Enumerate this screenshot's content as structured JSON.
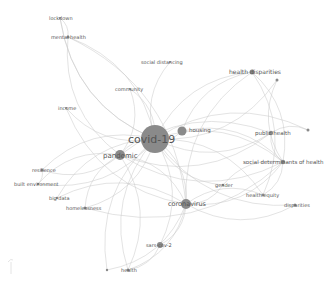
{
  "diagram": {
    "type": "keyword co-occurrence network",
    "center_node": "covid-19",
    "colors": {
      "background": "#ffffff",
      "edge": "#c9c9c9",
      "node": "#8a8a8a",
      "label": "#555555",
      "center_label": "#444444"
    },
    "nodes": [
      {
        "id": "covid-19",
        "label": "covid-19",
        "x": 155,
        "y": 139,
        "r": 14,
        "font": 11,
        "lx": 128,
        "ly": 143
      },
      {
        "id": "pandemic",
        "label": "pandemic",
        "x": 120,
        "y": 155,
        "r": 5,
        "font": 7,
        "lx": 103,
        "ly": 158
      },
      {
        "id": "coronavirus",
        "label": "coronavirus",
        "x": 186,
        "y": 204,
        "r": 5,
        "font": 6.5,
        "lx": 168,
        "ly": 206
      },
      {
        "id": "housing",
        "label": "housing",
        "x": 182,
        "y": 131,
        "r": 4.5,
        "font": 5.5,
        "lx": 189,
        "ly": 132
      },
      {
        "id": "health-disparities",
        "label": "health disparities",
        "x": 252,
        "y": 72,
        "r": 2.5,
        "font": 6,
        "lx": 229,
        "ly": 74
      },
      {
        "id": "public-health",
        "label": "public health",
        "x": 271,
        "y": 133,
        "r": 2.2,
        "font": 5.5,
        "lx": 255,
        "ly": 135
      },
      {
        "id": "social-determinants-of-health",
        "label": "social determinants of health",
        "x": 283,
        "y": 162,
        "r": 2.2,
        "font": 5.5,
        "lx": 243,
        "ly": 164
      },
      {
        "id": "gender",
        "label": "gender",
        "x": 223,
        "y": 185,
        "r": 1.2,
        "font": 5,
        "lx": 215,
        "ly": 187
      },
      {
        "id": "health-equity",
        "label": "health equity",
        "x": 263,
        "y": 195,
        "r": 1.5,
        "font": 5,
        "lx": 246,
        "ly": 197
      },
      {
        "id": "disparities",
        "label": "disparities",
        "x": 295,
        "y": 205,
        "r": 1.5,
        "font": 5,
        "lx": 284,
        "ly": 207
      },
      {
        "id": "sars-cov-2",
        "label": "sars-cov-2",
        "x": 160,
        "y": 245,
        "r": 3,
        "font": 5,
        "lx": 146,
        "ly": 247
      },
      {
        "id": "health",
        "label": "health",
        "x": 128,
        "y": 270,
        "r": 1.5,
        "font": 5,
        "lx": 121,
        "ly": 272
      },
      {
        "id": "homelessness",
        "label": "homelessness",
        "x": 85,
        "y": 208,
        "r": 1.5,
        "font": 5,
        "lx": 66,
        "ly": 210
      },
      {
        "id": "big-data",
        "label": "big data",
        "x": 57,
        "y": 198,
        "r": 1.2,
        "font": 5,
        "lx": 49,
        "ly": 200
      },
      {
        "id": "built-environment",
        "label": "built environment",
        "x": 38,
        "y": 184,
        "r": 1.2,
        "font": 5,
        "lx": 14,
        "ly": 186
      },
      {
        "id": "resilience",
        "label": "resilience",
        "x": 42,
        "y": 170,
        "r": 1.5,
        "font": 5,
        "lx": 32,
        "ly": 172
      },
      {
        "id": "income",
        "label": "income",
        "x": 66,
        "y": 108,
        "r": 1,
        "font": 5,
        "lx": 58,
        "ly": 110
      },
      {
        "id": "community",
        "label": "community",
        "x": 130,
        "y": 89,
        "r": 1,
        "font": 5,
        "lx": 115,
        "ly": 91
      },
      {
        "id": "social-distancing",
        "label": "social distancing",
        "x": 170,
        "y": 62,
        "r": 1,
        "font": 5,
        "lx": 141,
        "ly": 64
      },
      {
        "id": "mental-health",
        "label": "mental health",
        "x": 68,
        "y": 37,
        "r": 1.5,
        "font": 5,
        "lx": 51,
        "ly": 39
      },
      {
        "id": "lockdown",
        "label": "lockdown",
        "x": 60,
        "y": 18,
        "r": 1,
        "font": 5,
        "lx": 49,
        "ly": 20
      },
      {
        "id": "unlabeled-1",
        "label": "",
        "x": 277,
        "y": 80,
        "r": 1.5,
        "font": 5,
        "lx": 0,
        "ly": 0
      },
      {
        "id": "unlabeled-2",
        "label": "",
        "x": 308,
        "y": 130,
        "r": 1.5,
        "font": 5,
        "lx": 0,
        "ly": 0
      },
      {
        "id": "unlabeled-3",
        "label": "",
        "x": 107,
        "y": 270,
        "r": 1.2,
        "font": 5,
        "lx": 0,
        "ly": 0
      }
    ],
    "edges": [
      [
        "covid-19",
        "pandemic"
      ],
      [
        "covid-19",
        "coronavirus"
      ],
      [
        "covid-19",
        "housing"
      ],
      [
        "covid-19",
        "health-disparities"
      ],
      [
        "covid-19",
        "public-health"
      ],
      [
        "covid-19",
        "social-determinants-of-health"
      ],
      [
        "covid-19",
        "gender"
      ],
      [
        "covid-19",
        "health-equity"
      ],
      [
        "covid-19",
        "disparities"
      ],
      [
        "covid-19",
        "sars-cov-2"
      ],
      [
        "covid-19",
        "health"
      ],
      [
        "covid-19",
        "homelessness"
      ],
      [
        "covid-19",
        "big-data"
      ],
      [
        "covid-19",
        "built-environment"
      ],
      [
        "covid-19",
        "resilience"
      ],
      [
        "covid-19",
        "income"
      ],
      [
        "covid-19",
        "community"
      ],
      [
        "covid-19",
        "social-distancing"
      ],
      [
        "covid-19",
        "mental-health"
      ],
      [
        "covid-19",
        "lockdown"
      ],
      [
        "covid-19",
        "unlabeled-1"
      ],
      [
        "covid-19",
        "unlabeled-2"
      ],
      [
        "covid-19",
        "unlabeled-3"
      ],
      [
        "pandemic",
        "coronavirus"
      ],
      [
        "pandemic",
        "social-determinants-of-health"
      ],
      [
        "pandemic",
        "resilience"
      ],
      [
        "pandemic",
        "built-environment"
      ],
      [
        "pandemic",
        "mental-health"
      ],
      [
        "pandemic",
        "public-health"
      ],
      [
        "pandemic",
        "health"
      ],
      [
        "pandemic",
        "homelessness"
      ],
      [
        "coronavirus",
        "sars-cov-2"
      ],
      [
        "coronavirus",
        "social-determinants-of-health"
      ],
      [
        "coronavirus",
        "health-equity"
      ],
      [
        "coronavirus",
        "disparities"
      ],
      [
        "coronavirus",
        "health-disparities"
      ],
      [
        "coronavirus",
        "big-data"
      ],
      [
        "coronavirus",
        "health"
      ],
      [
        "coronavirus",
        "gender"
      ],
      [
        "health-disparities",
        "social-determinants-of-health"
      ],
      [
        "health-disparities",
        "housing"
      ],
      [
        "health-disparities",
        "health-equity"
      ],
      [
        "public-health",
        "social-determinants-of-health"
      ],
      [
        "public-health",
        "unlabeled-2"
      ],
      [
        "public-health",
        "pandemic"
      ],
      [
        "social-determinants-of-health",
        "health-equity"
      ],
      [
        "social-determinants-of-health",
        "gender"
      ],
      [
        "social-determinants-of-health",
        "unlabeled-1"
      ],
      [
        "mental-health",
        "lockdown"
      ],
      [
        "mental-health",
        "coronavirus"
      ],
      [
        "lockdown",
        "covid-19"
      ],
      [
        "community",
        "pandemic"
      ],
      [
        "income",
        "coronavirus"
      ],
      [
        "resilience",
        "built-environment"
      ],
      [
        "homelessness",
        "social-determinants-of-health"
      ],
      [
        "sars-cov-2",
        "health"
      ],
      [
        "unlabeled-3",
        "coronavirus"
      ],
      [
        "housing",
        "social-determinants-of-health"
      ]
    ]
  }
}
